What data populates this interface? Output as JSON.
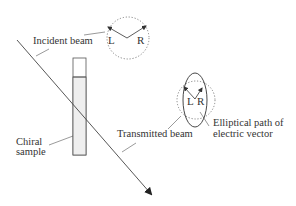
{
  "diagram": {
    "labels": {
      "incident_beam": "Incident beam",
      "chiral_sample_line1": "Chiral",
      "chiral_sample_line2": "sample",
      "transmitted_beam": "Transmitted beam",
      "elliptical_line1": "Elliptical path of",
      "elliptical_line2": "electric vector"
    },
    "incident_vectors": {
      "left": "L",
      "right": "R"
    },
    "transmitted_vectors": {
      "left": "L",
      "right": "R"
    },
    "colors": {
      "line": "#333333",
      "dashed": "#777777",
      "sample_fill": "#efefef",
      "background": "#ffffff"
    }
  }
}
